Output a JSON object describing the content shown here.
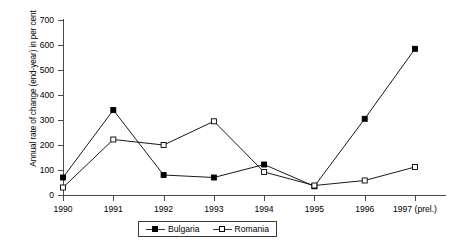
{
  "chart_data": {
    "type": "line",
    "title": "",
    "xlabel": "",
    "ylabel": "Annual rate of change (end-year) in per cent",
    "categories": [
      "1990",
      "1991",
      "1992",
      "1993",
      "1994",
      "1995",
      "1996",
      "1997 (prel.)"
    ],
    "ylim": [
      0,
      700
    ],
    "yticks": [
      0,
      100,
      200,
      300,
      400,
      500,
      600,
      700
    ],
    "grid": false,
    "legend_position": "bottom-center",
    "series": [
      {
        "name": "Bulgaria",
        "marker": "filled-square",
        "color": "#000000",
        "values": [
          70,
          340,
          80,
          70,
          122,
          35,
          305,
          585
        ]
      },
      {
        "name": "Romania",
        "marker": "hollow-square",
        "color": "#000000",
        "values": [
          30,
          222,
          200,
          295,
          92,
          38,
          58,
          112
        ]
      }
    ]
  },
  "axes": {
    "y_tick_labels": [
      "0",
      "100",
      "200",
      "300",
      "400",
      "500",
      "600",
      "700"
    ],
    "x_tick_labels": [
      "1990",
      "1991",
      "1992",
      "1993",
      "1994",
      "1995",
      "1996",
      "1997 (prel.)"
    ]
  },
  "legend": {
    "items": [
      {
        "label": "Bulgaria",
        "marker": "filled-square"
      },
      {
        "label": "Romania",
        "marker": "hollow-square"
      }
    ]
  }
}
